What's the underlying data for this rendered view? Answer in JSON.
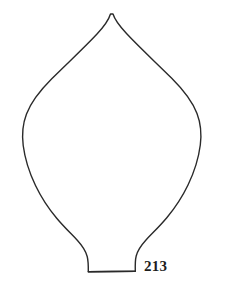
{
  "figure": {
    "label": "213",
    "caption_number": "213",
    "background_color": "#ffffff",
    "stroke_color": "#2a2a2a",
    "stroke_width": 1.4,
    "label_color": "#1d1d1d",
    "canvas": {
      "width": 226,
      "height": 292
    },
    "outline_path": "M 110.5 14 C 108.5 20.5 104 26.5 97 34 C 83 49 66.5 64 52 78.5 C 40 90.5 31 102 26.5 114 C 22.5 124.5 21.8 134.5 23.2 145.5 C 25 159.5 29.5 173 35.5 185.5 C 41.5 198 49 209 56.5 218 C 64 227 71.5 234 77.5 240.5 C 82.5 246 85.8 251 87.2 256.5 C 88.1 260 88.4 265 88.3 271.8 L 135.3 271.2 C 135.1 264.5 135.3 259.5 136.2 256 C 137.6 250.5 141 245.5 146 240 C 152 233.5 159.5 226.5 167 217.5 C 174.5 208.5 182 197.5 188 185 C 194 172.5 198.5 159 200.3 145 C 201.7 134 201 124 197 113.5 C 192.5 101.5 183.5 90 171.5 78 C 157 63.5 140.5 48.5 126.5 33.5 C 119.5 26 115 20.5 113 14 Z",
    "base_line_path": "M 88.3 271.8 L 135.3 271.2"
  }
}
